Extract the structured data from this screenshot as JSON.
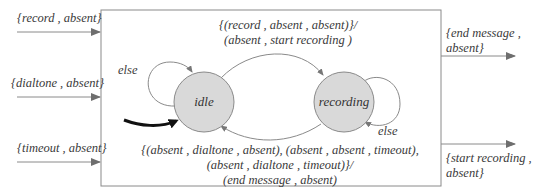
{
  "diagram": {
    "type": "finite-state-machine",
    "inputs": [
      {
        "label": "{record , absent}"
      },
      {
        "label": "{dialtone , absent}"
      },
      {
        "label": "{timeout , absent}"
      }
    ],
    "outputs": [
      {
        "line1": "{end message ,",
        "line2": "absent}"
      },
      {
        "line1": "{start recording ,",
        "line2": "absent}"
      }
    ],
    "states": [
      {
        "id": "idle",
        "label": "idle",
        "initial": true
      },
      {
        "id": "recording",
        "label": "recording",
        "initial": false
      }
    ],
    "transitions": {
      "idle_to_recording": {
        "line1": "{(record , absent , absent)}/",
        "line2": "(absent , start recording )"
      },
      "recording_to_idle": {
        "line1": "{(absent , dialtone , absent), (absent , absent , timeout),",
        "line2": "(absent , dialtone , timeout)}/",
        "line3": "(end message , absent)"
      },
      "idle_self": {
        "label": "else"
      },
      "recording_self": {
        "label": "else"
      }
    },
    "colors": {
      "state_fill": "#d9d9d9",
      "state_stroke": "#8a8a8a",
      "line": "#8a8a8a",
      "initial_arrow": "#111111",
      "box_stroke": "#8a8a8a"
    }
  }
}
